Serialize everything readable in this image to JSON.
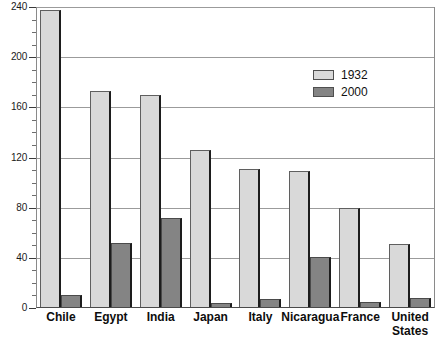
{
  "chart_data": {
    "type": "bar",
    "title": "",
    "subtitle": "",
    "xlabel": "",
    "ylabel": "",
    "ylim": [
      0,
      240
    ],
    "ytick_step": 40,
    "yminor_step": 10,
    "yticks": [
      0,
      40,
      80,
      120,
      160,
      200,
      240
    ],
    "grid": true,
    "grid_axis": "y",
    "legend_position": "upper-right-inside",
    "categories": [
      "Chile",
      "Egypt",
      "India",
      "Japan",
      "Italy",
      "Nicaragua",
      "France",
      "United States"
    ],
    "series": [
      {
        "name": "1932",
        "color": "#d9d9d9",
        "values": [
          238,
          173,
          170,
          126,
          111,
          109,
          80,
          51
        ]
      },
      {
        "name": "2000",
        "color": "#848484",
        "values": [
          10,
          52,
          72,
          4,
          7,
          41,
          5,
          8
        ]
      }
    ]
  },
  "legend": {
    "items": [
      {
        "label": "1932",
        "swatch": "light"
      },
      {
        "label": "2000",
        "swatch": "dark"
      }
    ]
  },
  "axis": {
    "y_tick_labels": [
      "0",
      "40",
      "80",
      "120",
      "160",
      "200",
      "240"
    ]
  },
  "xaxis": {
    "labels": [
      {
        "text": "Chile",
        "lines": [
          "Chile"
        ]
      },
      {
        "text": "Egypt",
        "lines": [
          "Egypt"
        ]
      },
      {
        "text": "India",
        "lines": [
          "India"
        ]
      },
      {
        "text": "Japan",
        "lines": [
          "Japan"
        ]
      },
      {
        "text": "Italy",
        "lines": [
          "Italy"
        ]
      },
      {
        "text": "Nicaragua",
        "lines": [
          "Nicaragua"
        ]
      },
      {
        "text": "France",
        "lines": [
          "France"
        ]
      },
      {
        "text": "United States",
        "lines": [
          "United",
          "States"
        ]
      }
    ]
  }
}
